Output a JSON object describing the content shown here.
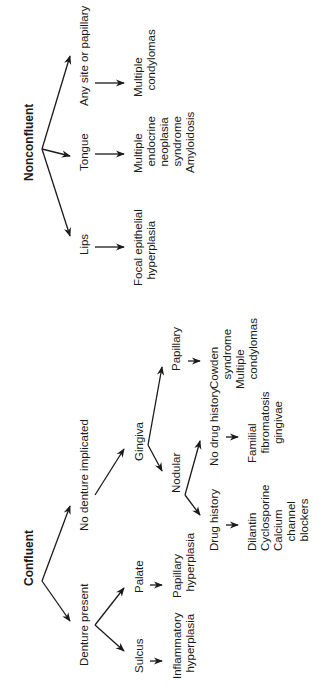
{
  "diagram": {
    "confluent": {
      "title": "Confluent",
      "denture_present": {
        "label": "Denture present",
        "sulcus": {
          "label": "Sulcus",
          "result": "Inflammatory\n  hyperplasia"
        },
        "palate": {
          "label": "Palate",
          "result": "Papillary\n  hyperplasia"
        }
      },
      "no_denture": {
        "label": "No denture implicated",
        "gingiva": {
          "label": "Gingiva",
          "nodular": {
            "label": "Nodular",
            "drug_history": {
              "label": "Drug history",
              "result": "Dilantin\nCyclosporine\nCalcium\n   channel\n   blockers"
            },
            "no_drug_history": {
              "label": "No drug history",
              "result": "Familial\n   fibromatosis\n      gingivae"
            }
          },
          "papillary": {
            "label": "Papillary",
            "result": "Cowden\n   syndrome\nMultiple\n   condylomas"
          }
        }
      }
    },
    "nonconfluent": {
      "title": "Nonconfluent",
      "lips": {
        "label": "Lips",
        "result": "Focal epithelial\n  hyperplasia"
      },
      "tongue": {
        "label": "Tongue",
        "result": "Multiple\n  endocrine\n  neoplasia\n  syndrome\nAmyloidosis"
      },
      "any_site": {
        "label": "Any site or papillary",
        "result": "Multiple\n  condylomas"
      }
    }
  }
}
